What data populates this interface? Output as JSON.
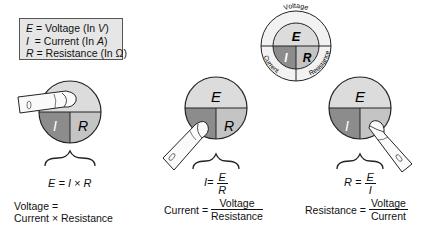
{
  "legend": {
    "rows": [
      {
        "symbol": "E",
        "sep": " = ",
        "text": "Voltage (In ",
        "unit": "V",
        "close": ")"
      },
      {
        "symbol": "I",
        "sep": "  = ",
        "text": "Current (In ",
        "unit": "A",
        "close": ")"
      },
      {
        "symbol": "R",
        "sep": " = ",
        "text": "Resistance (In ",
        "unit": "Ω",
        "close": ")"
      }
    ]
  },
  "wheel": {
    "ring_labels": {
      "top": "Voltage",
      "left": "Current",
      "right": "Resistance"
    },
    "segments": {
      "top": "E",
      "left": "I",
      "right": "R"
    }
  },
  "colors": {
    "E_segment": "#dcdcdc",
    "I_segment": "#8c8c8c",
    "R_segment": "#c4c4c4",
    "legend_bg": "#e6e6e6",
    "ring_bg": "#f2f2f2"
  },
  "panels": [
    {
      "covered": "E",
      "segments": {
        "top": "E",
        "left": "I",
        "right": "R"
      },
      "equation": {
        "lhs": "E",
        "rhs": "I × R"
      },
      "word_formula": {
        "line1": "Voltage =",
        "line2": "Current × Resistance"
      }
    },
    {
      "covered": "I",
      "segments": {
        "top": "E",
        "left": "I",
        "right": "R"
      },
      "equation": {
        "lhs": "I",
        "num": "E",
        "den": "R"
      },
      "word_formula": {
        "lhs": "Current =",
        "num": "Voltage",
        "den": "Resistance"
      }
    },
    {
      "covered": "R",
      "segments": {
        "top": "E",
        "left": "I",
        "right": "R"
      },
      "equation": {
        "lhs": "R",
        "num": "E",
        "den": "I"
      },
      "word_formula": {
        "lhs": "Resistance =",
        "num": "Voltage",
        "den": "Current"
      }
    }
  ]
}
